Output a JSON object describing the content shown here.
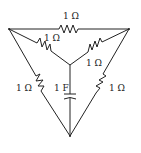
{
  "diagram": {
    "type": "circuit",
    "labels": {
      "top": "1 Ω",
      "upper_left_inner": "1 Ω",
      "upper_right_inner": "1 Ω",
      "left": "1 Ω",
      "right": "1 Ω",
      "capacitor": "1 F"
    },
    "components": [
      {
        "id": "R_top",
        "kind": "resistor",
        "value": "1 Ω",
        "between": [
          "A",
          "B"
        ]
      },
      {
        "id": "R_left_inner",
        "kind": "resistor",
        "value": "1 Ω",
        "between": [
          "A",
          "O"
        ]
      },
      {
        "id": "R_right_inner",
        "kind": "resistor",
        "value": "1 Ω",
        "between": [
          "B",
          "O"
        ]
      },
      {
        "id": "R_left",
        "kind": "resistor",
        "value": "1 Ω",
        "between": [
          "A",
          "C"
        ]
      },
      {
        "id": "R_right",
        "kind": "resistor",
        "value": "1 Ω",
        "between": [
          "B",
          "C"
        ]
      },
      {
        "id": "C_center",
        "kind": "capacitor",
        "value": "1 F",
        "between": [
          "O",
          "C"
        ]
      }
    ]
  }
}
